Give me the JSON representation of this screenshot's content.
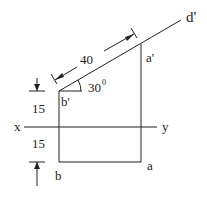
{
  "diagram": {
    "type": "orthographic-projection",
    "labels": {
      "d_prime": "d'",
      "a_prime": "a'",
      "b_prime": "b'",
      "a": "a",
      "b": "b",
      "x": "x",
      "y": "y"
    },
    "dimensions": {
      "length": "40",
      "angle": "30",
      "angle_unit": "0",
      "above_xy": "15",
      "below_xy": "15"
    },
    "colors": {
      "stroke": "#222222",
      "background": "#ffffff"
    }
  }
}
